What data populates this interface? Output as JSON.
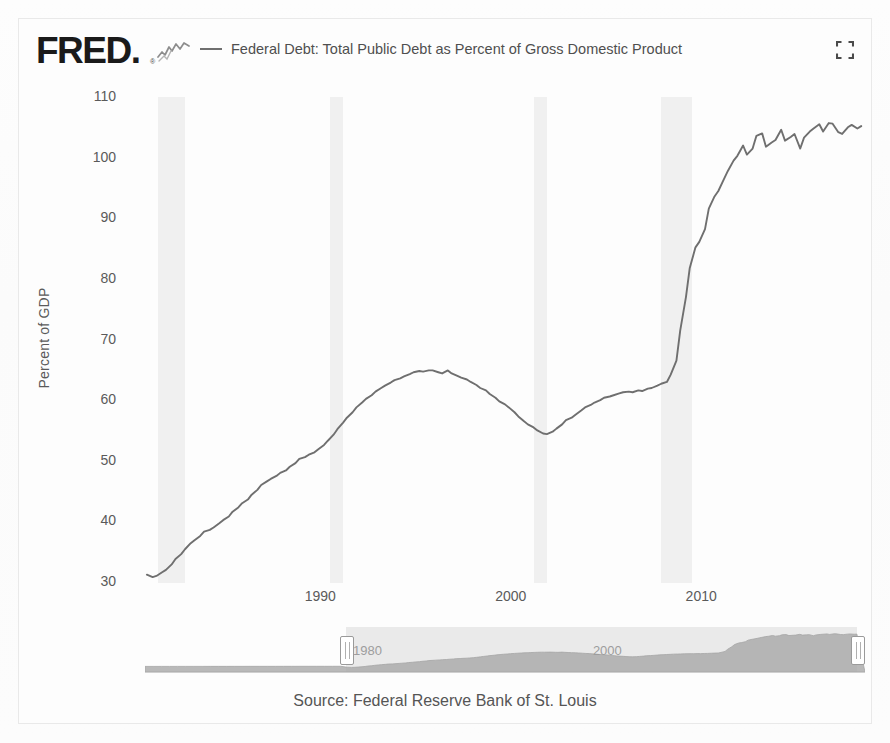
{
  "brand": {
    "logo_text": "FRED",
    "logo_dot": ".",
    "registered_mark": "®",
    "sparkline_icon": "sparkline-icon"
  },
  "header": {
    "legend_label": "Federal Debt: Total Public Debt as Percent of Gross Domestic Product",
    "fullscreen_icon": "fullscreen-icon",
    "line_color": "#6f6f6f"
  },
  "footer": {
    "source": "Source: Federal Reserve Bank of St. Louis"
  },
  "navigator": {
    "left_handle_label": "1980",
    "right_handle_label": "",
    "mid_label": "2000",
    "selection_start_year": 1980.8,
    "selection_end_year": 2018.4,
    "full_start_year": 1966,
    "full_end_year": 2019
  },
  "chart_data": {
    "type": "line",
    "title": "",
    "subtitle": "",
    "xlabel": "",
    "ylabel": "Percent of GDP",
    "xlim": [
      1980.8,
      2018.6
    ],
    "ylim": [
      30,
      110
    ],
    "yticks": [
      110,
      100,
      90,
      80,
      70,
      60,
      50,
      40,
      30
    ],
    "xticks": [
      1990,
      2000,
      2010
    ],
    "grid": false,
    "legend_position": "top",
    "series": [
      {
        "name": "Federal Debt: Total Public Debt as Percent of Gross Domestic Product",
        "color": "#6f6f6f",
        "units": "Percent of GDP",
        "x": [
          1980.9,
          1981.2,
          1981.4,
          1981.7,
          1981.9,
          1982.2,
          1982.4,
          1982.7,
          1982.9,
          1983.2,
          1983.4,
          1983.7,
          1983.9,
          1984.2,
          1984.4,
          1984.7,
          1984.9,
          1985.2,
          1985.4,
          1985.7,
          1985.9,
          1986.2,
          1986.4,
          1986.7,
          1986.9,
          1987.2,
          1987.4,
          1987.7,
          1987.9,
          1988.2,
          1988.4,
          1988.7,
          1988.9,
          1989.2,
          1989.4,
          1989.7,
          1989.9,
          1990.2,
          1990.4,
          1990.7,
          1990.9,
          1991.2,
          1991.4,
          1991.7,
          1991.9,
          1992.2,
          1992.4,
          1992.7,
          1992.9,
          1993.2,
          1993.4,
          1993.7,
          1993.9,
          1994.2,
          1994.4,
          1994.7,
          1994.9,
          1995.2,
          1995.4,
          1995.7,
          1995.9,
          1996.2,
          1996.4,
          1996.7,
          1996.9,
          1997.2,
          1997.4,
          1997.7,
          1997.9,
          1998.2,
          1998.4,
          1998.7,
          1998.9,
          1999.2,
          1999.4,
          1999.7,
          1999.9,
          2000.2,
          2000.4,
          2000.7,
          2000.9,
          2001.2,
          2001.4,
          2001.7,
          2001.9,
          2002.2,
          2002.4,
          2002.7,
          2002.9,
          2003.2,
          2003.4,
          2003.7,
          2003.9,
          2004.2,
          2004.4,
          2004.7,
          2004.9,
          2005.2,
          2005.4,
          2005.7,
          2005.9,
          2006.2,
          2006.4,
          2006.7,
          2006.9,
          2007.2,
          2007.4,
          2007.7,
          2007.9,
          2008.2,
          2008.4,
          2008.7,
          2008.9,
          2009.2,
          2009.4,
          2009.7,
          2009.9,
          2010.2,
          2010.4,
          2010.7,
          2010.9,
          2011.2,
          2011.4,
          2011.7,
          2011.9,
          2012.2,
          2012.4,
          2012.7,
          2012.9,
          2013.2,
          2013.4,
          2013.7,
          2013.9,
          2014.2,
          2014.4,
          2014.7,
          2014.9,
          2015.2,
          2015.4,
          2015.7,
          2015.9,
          2016.2,
          2016.4,
          2016.7,
          2016.9,
          2017.2,
          2017.4,
          2017.7,
          2017.9,
          2018.2,
          2018.4
        ],
        "y": [
          31.2,
          30.8,
          31.0,
          31.6,
          32.0,
          32.9,
          33.8,
          34.6,
          35.4,
          36.4,
          36.9,
          37.6,
          38.3,
          38.6,
          39.0,
          39.7,
          40.2,
          40.8,
          41.6,
          42.3,
          43.0,
          43.6,
          44.4,
          45.2,
          46.0,
          46.6,
          47.0,
          47.5,
          48.0,
          48.4,
          49.0,
          49.6,
          50.3,
          50.6,
          51.0,
          51.4,
          51.9,
          52.6,
          53.3,
          54.3,
          55.2,
          56.3,
          57.1,
          58.0,
          58.8,
          59.6,
          60.2,
          60.8,
          61.4,
          62.0,
          62.4,
          62.9,
          63.3,
          63.6,
          63.9,
          64.3,
          64.6,
          64.8,
          64.7,
          64.9,
          64.9,
          64.6,
          64.4,
          64.9,
          64.4,
          64.0,
          63.7,
          63.4,
          63.0,
          62.5,
          62.0,
          61.6,
          61.0,
          60.4,
          59.8,
          59.3,
          58.8,
          58.0,
          57.3,
          56.5,
          56.0,
          55.5,
          55.0,
          54.5,
          54.4,
          54.8,
          55.3,
          56.0,
          56.7,
          57.1,
          57.6,
          58.3,
          58.8,
          59.2,
          59.6,
          60.0,
          60.4,
          60.6,
          60.8,
          61.1,
          61.3,
          61.4,
          61.3,
          61.6,
          61.5,
          61.9,
          62.0,
          62.4,
          62.7,
          63.0,
          64.2,
          66.5,
          71.5,
          77.0,
          81.8,
          85.2,
          86.1,
          88.2,
          91.6,
          93.6,
          94.5,
          96.5,
          97.8,
          99.5,
          100.3,
          102.0,
          100.5,
          101.5,
          103.6,
          104.0,
          101.8,
          102.5,
          102.9,
          104.6,
          102.8,
          103.4,
          103.9,
          101.5,
          103.3,
          104.3,
          104.8,
          105.5,
          104.3,
          105.7,
          105.6,
          104.2,
          103.9,
          105.0,
          105.4,
          104.8,
          105.2
        ]
      }
    ],
    "recession_bands": [
      {
        "start": 1981.5,
        "end": 1982.9,
        "label": "1981-82 recession"
      },
      {
        "start": 1990.5,
        "end": 1991.2,
        "label": "1990-91 recession"
      },
      {
        "start": 2001.2,
        "end": 2001.9,
        "label": "2001 recession"
      },
      {
        "start": 2007.9,
        "end": 2009.5,
        "label": "2008-09 recession"
      }
    ],
    "recession_band_color": "#f0f0f0"
  }
}
